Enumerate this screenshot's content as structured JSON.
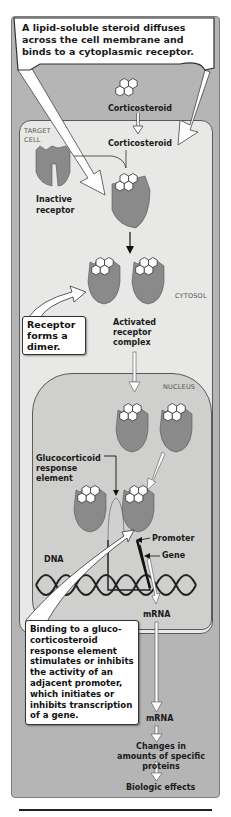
{
  "figure": {
    "title_callout": "A lipid-soluble steroid diffuses across the cell membrane and binds to a cytoplasmic receptor.",
    "dimer_callout": "Receptor forms a dimer.",
    "binding_callout": "Binding to a gluco-corticosteroid response element stimulates or inhibits the activity of an adjacent promoter, which initiates or inhibits transcription of a gene.",
    "labels": {
      "corticosteroid_outside": "Corticosteroid",
      "corticosteroid_inside": "Corticosteroid",
      "target_cell": "TARGET CELL",
      "inactive_receptor": "Inactive receptor",
      "cytosol": "CYTOSOL",
      "activated_complex": "Activated receptor complex",
      "nucleus": "NUCLEUS",
      "gre": "Glucocorticoid response element",
      "promoter": "Promoter",
      "gene": "Gene",
      "dna": "DNA",
      "mrna_nucleus": "mRNA",
      "mrna_cytosol": "mRNA",
      "protein_changes": "Changes in amounts of specific proteins",
      "biologic_effects": "Biologic effects"
    },
    "colors": {
      "outer_bg": "#b5b5b5",
      "cell_bg": "#e8e8e6",
      "nucleus_bg": "#cfcfcd",
      "receptor": "#8a8a8a",
      "callout_bg": "#ffffff",
      "text": "#1a1a1a"
    }
  }
}
